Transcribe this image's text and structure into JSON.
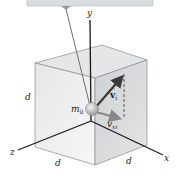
{
  "diagram": {
    "labels": {
      "y_axis": "y",
      "x_axis": "x",
      "z_axis": "z",
      "mass": "m",
      "mass_sub": "0",
      "velocity": "v",
      "velocity_sub": "i",
      "velocity_x": "v",
      "velocity_x_sub": "xi",
      "edge_left": "d",
      "edge_front_left": "d",
      "edge_front_right": "d"
    },
    "colors": {
      "support_bar": "#d9dcde",
      "cube_top": "#e4e6e7",
      "cube_front_left": "#ececec",
      "cube_front_right": "#d6d8da",
      "axis": "#1a1a1a",
      "string": "#6e6e6e",
      "ball": "#c9c9c9",
      "vector": "#444444"
    }
  }
}
